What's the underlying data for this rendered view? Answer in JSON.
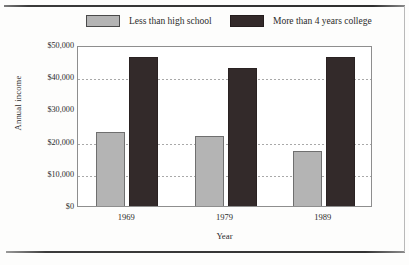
{
  "chart_data": {
    "type": "bar",
    "title": "",
    "xlabel": "Year",
    "ylabel": "Annual income",
    "categories": [
      "1969",
      "1979",
      "1989"
    ],
    "series": [
      {
        "name": "Less than high school",
        "color": "#b4b4b4",
        "values": [
          22900,
          21700,
          17100
        ]
      },
      {
        "name": "More than 4 years college",
        "color": "#332a2a",
        "values": [
          46300,
          43000,
          46300
        ]
      }
    ],
    "ylim": [
      0,
      50000
    ],
    "ytick_values": [
      50000,
      40000,
      30000,
      20000,
      10000,
      0
    ],
    "ytick_labels": [
      "$50,000",
      "$40,000",
      "$30,000",
      "$20,000",
      "$10,000",
      "$0"
    ],
    "grid": true,
    "gridlines_at": [
      40000,
      20000,
      10000
    ],
    "legend_position": "top"
  },
  "legend": {
    "entries": [
      {
        "label": "Less than high school",
        "swatch": "light"
      },
      {
        "label": "More than 4 years college",
        "swatch": "dark"
      }
    ]
  },
  "axes": {
    "y_title": "Annual income",
    "x_title": "Year"
  }
}
